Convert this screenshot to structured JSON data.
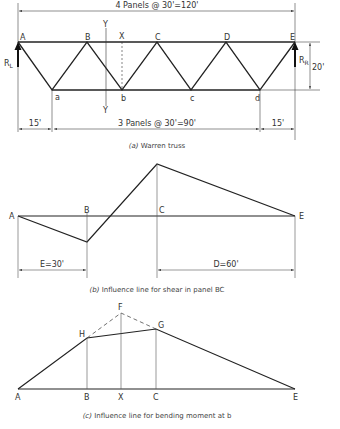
{
  "truss": {
    "top_dim": "4 Panels @ 30'=120'",
    "bottom_dim_left": "15'",
    "bottom_dim_mid": "3 Panels @ 30'=90'",
    "bottom_dim_right": "15'",
    "height_dim": "20'",
    "nodes_top": [
      "A",
      "B",
      "C",
      "D",
      "E"
    ],
    "nodes_bottom": [
      "a",
      "b",
      "c",
      "d"
    ],
    "section_x": "X",
    "section_y_top": "Y",
    "section_y_bottom": "Y",
    "reaction_left": "R",
    "reaction_left_sub": "L",
    "reaction_right": "R",
    "reaction_right_sub": "R",
    "caption_letter": "(a)",
    "caption_text": "Warren truss"
  },
  "shear_il": {
    "labels": [
      "A",
      "B",
      "C",
      "E"
    ],
    "dim_left": "E=30'",
    "dim_right": "D=60'",
    "caption_letter": "(b)",
    "caption_text": "Influence line for shear in panel BC"
  },
  "moment_il": {
    "labels": [
      "A",
      "B",
      "X",
      "C",
      "E",
      "F",
      "G",
      "H"
    ],
    "caption_letter": "(c)",
    "caption_text": "Influence line for bending moment at b"
  }
}
